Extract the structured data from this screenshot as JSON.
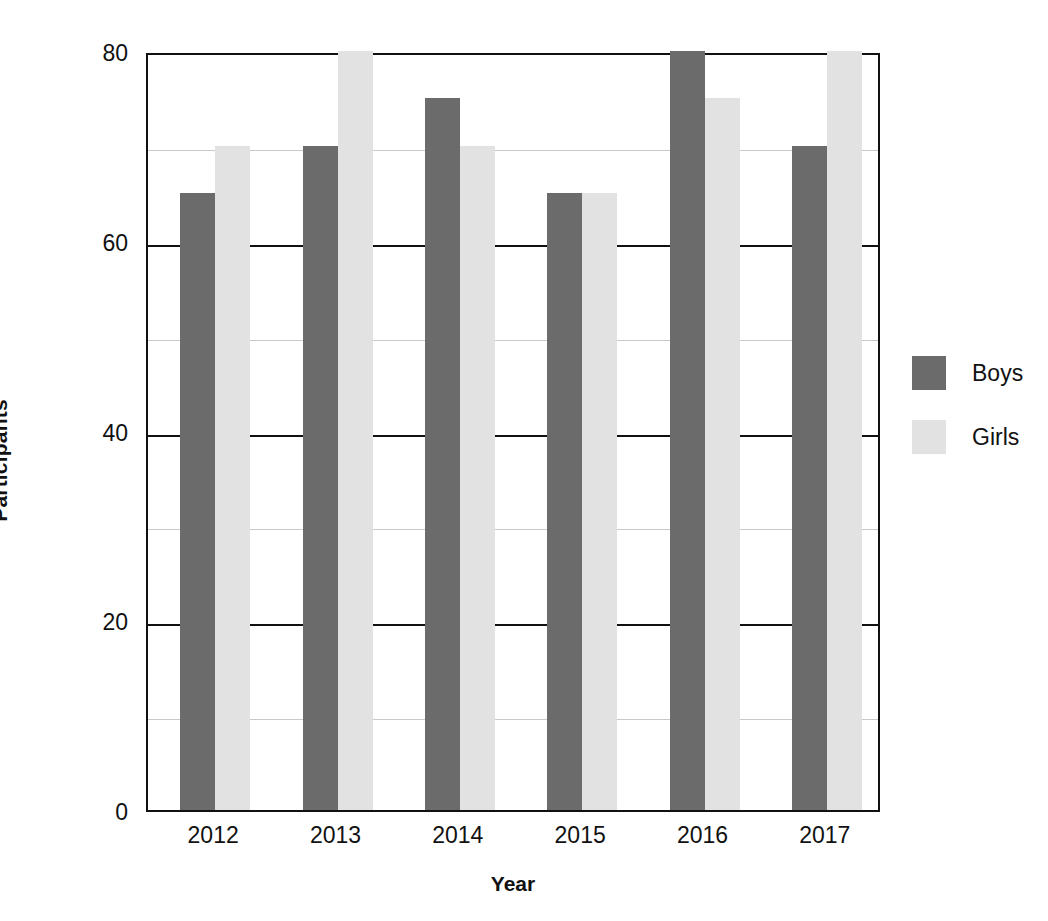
{
  "chart_data": {
    "type": "bar",
    "title": "",
    "xlabel": "Year",
    "ylabel": "Participants",
    "categories": [
      "2012",
      "2013",
      "2014",
      "2015",
      "2016",
      "2017"
    ],
    "series": [
      {
        "name": "Boys",
        "color": "#6b6b6b",
        "values": [
          65,
          70,
          75,
          65,
          80,
          70
        ]
      },
      {
        "name": "Girls",
        "color": "#e2e2e2",
        "values": [
          70,
          80,
          70,
          65,
          75,
          80
        ]
      }
    ],
    "ylim": [
      0,
      80
    ],
    "yticks": [
      0,
      20,
      40,
      60,
      80
    ],
    "ytick_labels": [
      "0",
      "20",
      "40",
      "60",
      "80"
    ],
    "yminor": [
      10,
      30,
      50,
      70
    ],
    "grid": true,
    "legend_position": "right",
    "legend_entries": [
      "Boys",
      "Girls"
    ]
  },
  "axes": {
    "y_title": "Participants",
    "x_title": "Year"
  }
}
